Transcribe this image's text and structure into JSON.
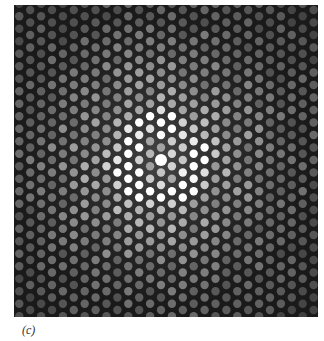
{
  "figure": {
    "panel_label": "(c)",
    "background_color": "#1a1a1a",
    "spot_color": "#ffffff",
    "pattern": {
      "center": [
        147,
        155
      ],
      "row_spacing": 12.5,
      "col_spacing": 10.9,
      "central_spot_radius": 6,
      "spot_radius": 4.2,
      "bright_ring_radius": 37,
      "bright_ring_width": 12,
      "falloff_radius": 150
    }
  }
}
